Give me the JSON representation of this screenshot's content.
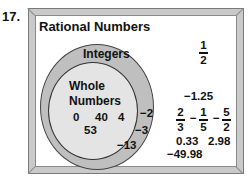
{
  "problem_number": "17.",
  "diagram": {
    "title": "Rational Numbers",
    "sets": {
      "integers": {
        "label": "Integers",
        "elements": [
          "−2",
          "−3",
          "−13"
        ]
      },
      "whole_numbers": {
        "label_line1": "Whole",
        "label_line2": "Numbers",
        "elements": [
          "0",
          "40",
          "4",
          "53"
        ]
      }
    },
    "rational_only": {
      "fraction_half": {
        "numerator": "1",
        "denominator": "2"
      },
      "decimal_neg_1_25": "−1.25",
      "fraction_two_thirds": {
        "numerator": "2",
        "denominator": "3"
      },
      "fraction_neg_one_fifth": {
        "sign": "−",
        "numerator": "1",
        "denominator": "5"
      },
      "fraction_neg_five_halves": {
        "sign": "−",
        "numerator": "5",
        "denominator": "2"
      },
      "decimal_0_33": "0.33",
      "decimal_2_98": "2.98",
      "decimal_neg_49_98": "−49.98"
    },
    "colors": {
      "integers_ring": "#bfbfbf",
      "whole_numbers_fill": "#e4e4e4",
      "frame": "#c9c9c9"
    }
  }
}
